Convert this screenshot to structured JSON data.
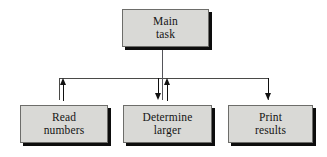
{
  "diagram": {
    "background": "#ffffff",
    "box_fill": "#d9d9d6",
    "box_border": "#6d6d6a",
    "shadow_color": "#0d0d0d",
    "line_color": "#4a4a48",
    "arrow_color": "#111111",
    "nodes": [
      {
        "id": "main-task",
        "line1": "Main",
        "line2": "task",
        "x": 122,
        "y": 9,
        "w": 87,
        "h": 38
      },
      {
        "id": "read-numbers",
        "line1": "Read",
        "line2": "numbers",
        "x": 20,
        "y": 105,
        "w": 88,
        "h": 38
      },
      {
        "id": "determine-larger",
        "line1": "Determine",
        "line2": "larger",
        "x": 123,
        "y": 105,
        "w": 89,
        "h": 38
      },
      {
        "id": "print-results",
        "line1": "Print",
        "line2": "results",
        "x": 228,
        "y": 105,
        "w": 85,
        "h": 38
      }
    ],
    "connectors": {
      "bus_y": 78,
      "bus_left_x": 59,
      "bus_right_x": 268,
      "main_stem_x": 163,
      "arrows": [
        {
          "id": "arrow-read-numbers-up",
          "direction": "up",
          "x": 63,
          "tip_y": 84
        },
        {
          "id": "arrow-determine-down",
          "direction": "down",
          "x": 158,
          "tip_y": 100
        },
        {
          "id": "arrow-determine-up",
          "direction": "up",
          "x": 167,
          "tip_y": 84
        },
        {
          "id": "arrow-print-results-down",
          "direction": "down",
          "x": 268,
          "tip_y": 100
        }
      ]
    }
  }
}
